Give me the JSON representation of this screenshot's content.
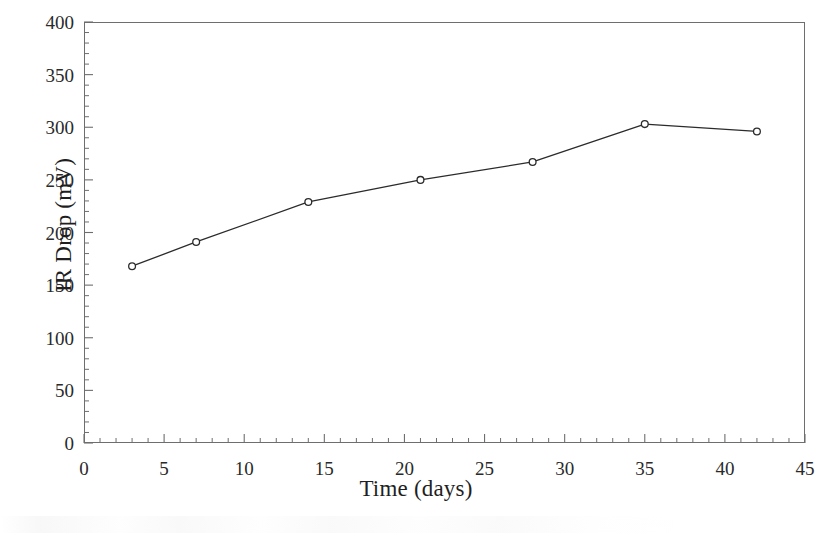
{
  "chart_data": {
    "type": "line",
    "title": "",
    "subtitle": "",
    "xlabel": "Time (days)",
    "ylabel": "IR Drop (mV)",
    "xlim": [
      0,
      45
    ],
    "ylim": [
      0,
      400
    ],
    "x_major_step": 5,
    "x_minor_step": 1,
    "y_major_step": 50,
    "y_minor_step": 10,
    "grid": false,
    "legend": null,
    "legend_position": "none",
    "frame": "box",
    "tick_direction": "in",
    "line_color": "#2b2b2b",
    "marker": "open-circle",
    "marker_color": "#2b2b2b",
    "x": [
      3,
      7,
      14,
      21,
      28,
      35,
      42
    ],
    "values": [
      168,
      191,
      229,
      250,
      267,
      303,
      296
    ],
    "series": [
      {
        "name": "IR Drop",
        "x": [
          3,
          7,
          14,
          21,
          28,
          35,
          42
        ],
        "values": [
          168,
          191,
          229,
          250,
          267,
          303,
          296
        ]
      }
    ],
    "points": [
      {
        "x": 3,
        "y": 168
      },
      {
        "x": 7,
        "y": 191
      },
      {
        "x": 14,
        "y": 229
      },
      {
        "x": 21,
        "y": 250
      },
      {
        "x": 28,
        "y": 267
      },
      {
        "x": 35,
        "y": 303
      },
      {
        "x": 42,
        "y": 296
      }
    ],
    "x_tick_labels": [
      "0",
      "5",
      "10",
      "15",
      "20",
      "25",
      "30",
      "35",
      "40",
      "45"
    ],
    "y_tick_labels": [
      "0",
      "50",
      "100",
      "150",
      "200",
      "250",
      "300",
      "350",
      "400"
    ],
    "annotations": []
  },
  "axes": {
    "x_title": "Time (days)",
    "y_title": "IR Drop (mV)"
  },
  "colors": {
    "background": "#ffffff",
    "frame": "#6e6e6e",
    "data_line": "#2b2b2b",
    "text": "#1f1f1f"
  }
}
